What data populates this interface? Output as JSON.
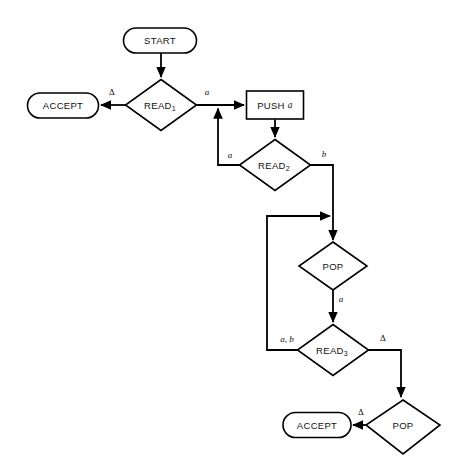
{
  "diagram": {
    "type": "flowchart",
    "colors": {
      "stroke": "#000000",
      "fill": "#ffffff",
      "background": "#ffffff"
    },
    "nodes": [
      {
        "id": "start",
        "kind": "terminator",
        "label": "START",
        "cx": 160,
        "cy": 40,
        "w": 73,
        "h": 25
      },
      {
        "id": "accept1",
        "kind": "terminator",
        "label": "ACCEPT",
        "cx": 63,
        "cy": 105,
        "w": 71,
        "h": 25
      },
      {
        "id": "read1",
        "kind": "decision",
        "label": "READ",
        "sub": "1",
        "cx": 161,
        "cy": 105,
        "w": 70,
        "h": 51
      },
      {
        "id": "push_a",
        "kind": "process",
        "label": "PUSH",
        "italic": "a",
        "cx": 275,
        "cy": 105,
        "w": 57,
        "h": 28
      },
      {
        "id": "read2",
        "kind": "decision",
        "label": "READ",
        "sub": "2",
        "cx": 275,
        "cy": 165,
        "w": 70,
        "h": 51
      },
      {
        "id": "pop1",
        "kind": "decision",
        "label": "POP",
        "cx": 333,
        "cy": 266,
        "w": 68,
        "h": 48
      },
      {
        "id": "read3",
        "kind": "decision",
        "label": "READ",
        "sub": "3",
        "cx": 333,
        "cy": 350,
        "w": 70,
        "h": 51
      },
      {
        "id": "pop2",
        "kind": "decision",
        "label": "POP",
        "cx": 403,
        "cy": 427,
        "w": 73,
        "h": 54
      },
      {
        "id": "accept2",
        "kind": "terminator",
        "label": "ACCEPT",
        "cx": 316,
        "cy": 425,
        "w": 68,
        "h": 25
      }
    ],
    "edges": [
      {
        "id": "e-start-read1",
        "from": "start",
        "to": "read1",
        "label": "",
        "arrow": true
      },
      {
        "id": "e-read1-accept1",
        "from": "read1",
        "to": "accept1",
        "label": "Δ",
        "arrow": true,
        "label_style": "upright"
      },
      {
        "id": "e-read1-push",
        "from": "read1",
        "to": "push_a",
        "label": "a",
        "arrow": true
      },
      {
        "id": "e-push-read2",
        "from": "push_a",
        "to": "read2",
        "label": "",
        "arrow": true
      },
      {
        "id": "e-read2-loop-a",
        "from": "read2",
        "to": "push_a",
        "label": "a",
        "arrow": true
      },
      {
        "id": "e-read2-b",
        "from": "read2",
        "to": "pop1",
        "label": "b",
        "arrow": true
      },
      {
        "id": "e-pop1-read3",
        "from": "pop1",
        "to": "read3",
        "label": "a",
        "arrow": true
      },
      {
        "id": "e-read3-loop",
        "from": "read3",
        "to": "pop1",
        "label": "a, b",
        "arrow": true
      },
      {
        "id": "e-read3-pop2",
        "from": "read3",
        "to": "pop2",
        "label": "Δ",
        "arrow": true,
        "label_style": "upright"
      },
      {
        "id": "e-pop2-accept2",
        "from": "pop2",
        "to": "accept2",
        "label": "Δ",
        "arrow": true,
        "label_style": "upright"
      }
    ],
    "edge_labels": {
      "read1_delta": "Δ",
      "read1_a": "a",
      "read2_a": "a",
      "read2_b": "b",
      "pop1_a": "a",
      "read3_ab": "a, b",
      "read3_delta": "Δ",
      "pop2_delta": "Δ"
    },
    "node_labels": {
      "start": "START",
      "accept_top": "ACCEPT",
      "read1": "READ",
      "read1_sub": "1",
      "push": "PUSH",
      "push_sym": "a",
      "read2": "READ",
      "read2_sub": "2",
      "pop_top": "POP",
      "read3": "READ",
      "read3_sub": "3",
      "pop_bottom": "POP",
      "accept_bottom": "ACCEPT"
    }
  }
}
